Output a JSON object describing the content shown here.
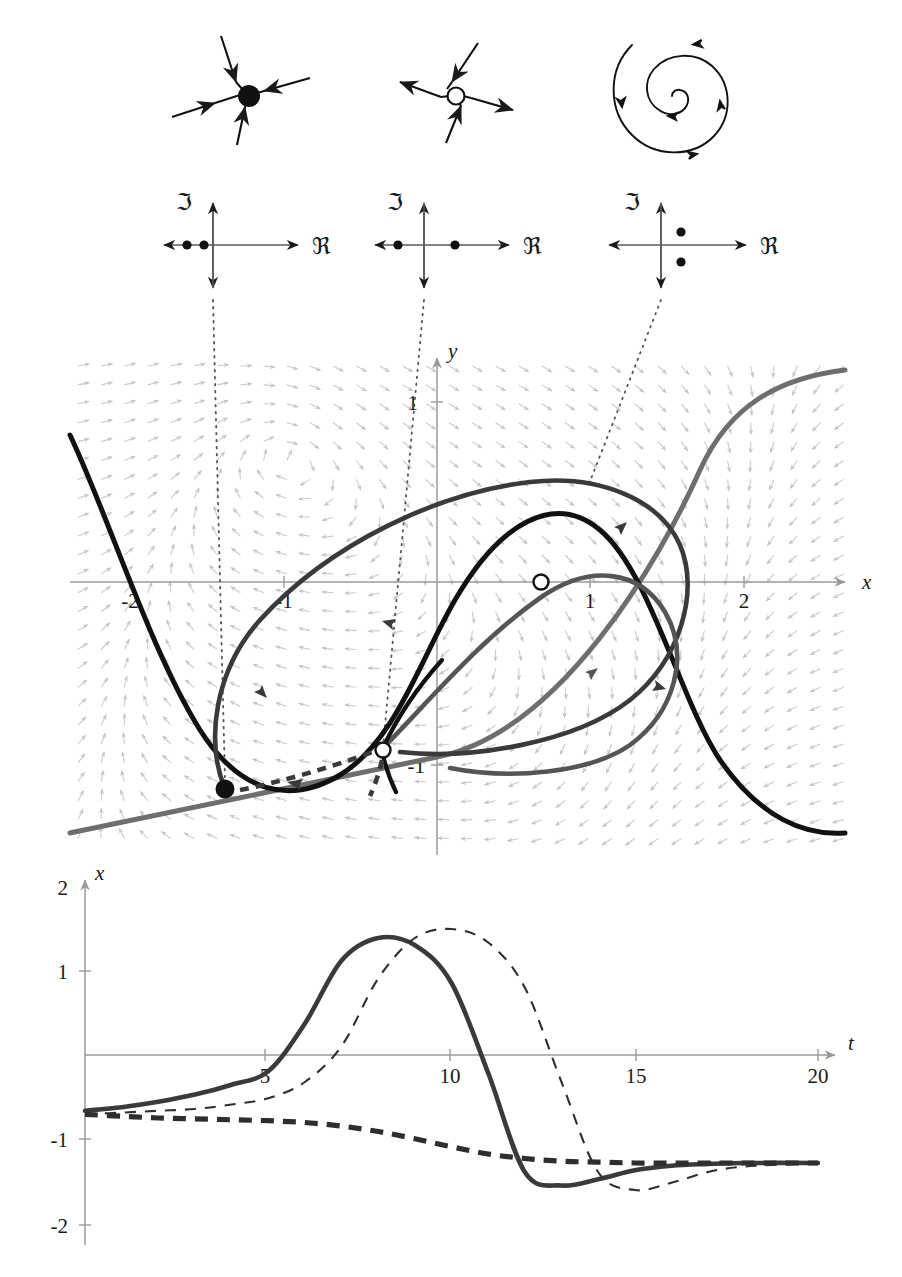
{
  "figure": {
    "panels": [
      "portrait-icons",
      "eigenvalue-planes",
      "phase-plane",
      "time-series"
    ]
  },
  "colors": {
    "ink": "#1a1a1a",
    "axis": "#9a9a9a",
    "vector_field": "#c8c8c8",
    "nullcline_black": "#111111",
    "nullcline_gray": "#6e6e6e",
    "trajectory_dark": "#3a3a3a",
    "trajectory_mid": "#555555",
    "guide_dotted": "#555555"
  },
  "portrait_icons": [
    {
      "name": "stable-node",
      "marker": "filled",
      "arrow_direction": "inward",
      "spokes": 4
    },
    {
      "name": "saddle",
      "marker": "open",
      "arrow_direction": "mixed",
      "spokes": 4
    },
    {
      "name": "unstable-spiral",
      "marker": "spiral",
      "arrow_direction": "outward",
      "turns": 3
    }
  ],
  "eigenvalue_planes": [
    {
      "name": "stable-node-eigenvalues",
      "imaginary_label": "ℑ",
      "real_label": "ℜ",
      "points": [
        {
          "re": -0.62,
          "im": 0
        },
        {
          "re": -0.26,
          "im": 0
        }
      ]
    },
    {
      "name": "saddle-eigenvalues",
      "imaginary_label": "ℑ",
      "real_label": "ℜ",
      "points": [
        {
          "re": -0.55,
          "im": 0
        },
        {
          "re": 0.45,
          "im": 0
        }
      ]
    },
    {
      "name": "unstable-spiral-eigenvalues",
      "imaginary_label": "ℑ",
      "real_label": "ℜ",
      "points": [
        {
          "re": 0.28,
          "im": 0.45
        },
        {
          "re": 0.28,
          "im": -0.45
        }
      ]
    }
  ],
  "phase_plane": {
    "xlabel": "x",
    "ylabel": "y",
    "xticks": [
      "-2",
      "-1",
      "1",
      "2"
    ],
    "yticks": [
      "1",
      "-1"
    ],
    "xlim": [
      -2.4,
      2.7
    ],
    "ylim": [
      -1.55,
      1.35
    ],
    "equilibria": [
      {
        "name": "stable-node",
        "x": -1.45,
        "y": -1.21,
        "marker": "filled"
      },
      {
        "name": "saddle",
        "x": -0.09,
        "y": -1.05,
        "marker": "open"
      },
      {
        "name": "unstable-spiral",
        "x": 0.42,
        "y": 0.0,
        "marker": "open"
      }
    ],
    "nullclines": [
      {
        "name": "cubic-nullcline",
        "style": "solid-black"
      },
      {
        "name": "linear-nullcline",
        "style": "solid-gray"
      }
    ],
    "trajectories": [
      {
        "name": "outer-loop-trajectory",
        "style": "solid-dark",
        "arrows": 4
      },
      {
        "name": "inner-loop-trajectory",
        "style": "solid-dark",
        "arrows": 2
      },
      {
        "name": "stable-manifold",
        "style": "dashed-dark",
        "arrows": 1
      }
    ],
    "guides": [
      {
        "name": "guide-to-stable-node",
        "from_diagram": 0
      },
      {
        "name": "guide-to-saddle",
        "from_diagram": 1
      },
      {
        "name": "guide-to-spiral",
        "from_diagram": 2
      }
    ]
  },
  "chart_data": {
    "type": "line",
    "title": "",
    "xlabel": "t",
    "ylabel": "x",
    "xlim": [
      0,
      20
    ],
    "ylim": [
      -2,
      2
    ],
    "xticks": [
      5,
      10,
      15,
      20
    ],
    "yticks": [
      2,
      1,
      -1,
      -2
    ],
    "grid": false,
    "legend": "none",
    "series": [
      {
        "name": "solid-thick-trajectory",
        "style": "solid",
        "x": [
          0,
          1,
          2,
          3,
          4,
          5,
          6,
          7,
          8,
          9,
          10,
          11,
          12,
          13,
          14,
          15,
          16,
          17,
          18,
          20
        ],
        "values": [
          -0.62,
          -0.58,
          -0.52,
          -0.44,
          -0.33,
          -0.18,
          0.35,
          1.05,
          1.3,
          1.22,
          0.8,
          -0.2,
          -1.3,
          -1.45,
          -1.38,
          -1.28,
          -1.23,
          -1.21,
          -1.2,
          -1.2
        ]
      },
      {
        "name": "thin-dashed-trajectory",
        "style": "dashed-thin",
        "x": [
          0,
          1,
          2,
          3,
          4,
          5,
          6,
          7,
          8,
          9,
          10,
          11,
          12,
          13,
          14,
          15,
          16,
          17,
          18,
          20
        ],
        "values": [
          -0.66,
          -0.64,
          -0.62,
          -0.6,
          -0.55,
          -0.48,
          -0.3,
          0.1,
          0.85,
          1.3,
          1.4,
          1.25,
          0.75,
          -0.3,
          -1.3,
          -1.5,
          -1.42,
          -1.3,
          -1.24,
          -1.2
        ]
      },
      {
        "name": "thick-dashed-trajectory",
        "style": "dashed-thick",
        "x": [
          0,
          1,
          2,
          3,
          4,
          5,
          6,
          7,
          8,
          9,
          10,
          11,
          12,
          13,
          14,
          15,
          16,
          17,
          18,
          20
        ],
        "values": [
          -0.66,
          -0.68,
          -0.7,
          -0.71,
          -0.72,
          -0.73,
          -0.75,
          -0.79,
          -0.85,
          -0.93,
          -1.02,
          -1.1,
          -1.15,
          -1.18,
          -1.19,
          -1.2,
          -1.2,
          -1.2,
          -1.2,
          -1.2
        ]
      }
    ]
  }
}
